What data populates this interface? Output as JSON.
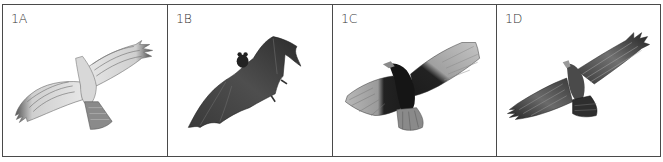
{
  "figure": {
    "panels": [
      {
        "label": "1A",
        "subject": "hawk-in-flight (light barred wings, banded tail)"
      },
      {
        "label": "1B",
        "subject": "bat-in-flight (dark membrane wings)"
      },
      {
        "label": "1C",
        "subject": "vulture-in-flight (dark body, pale flight feathers)"
      },
      {
        "label": "1D",
        "subject": "eagle-in-flight (dark streaked wings)"
      }
    ],
    "colors": {
      "border": "#4a4a4a",
      "label": "#333333",
      "background": "#ffffff"
    }
  }
}
